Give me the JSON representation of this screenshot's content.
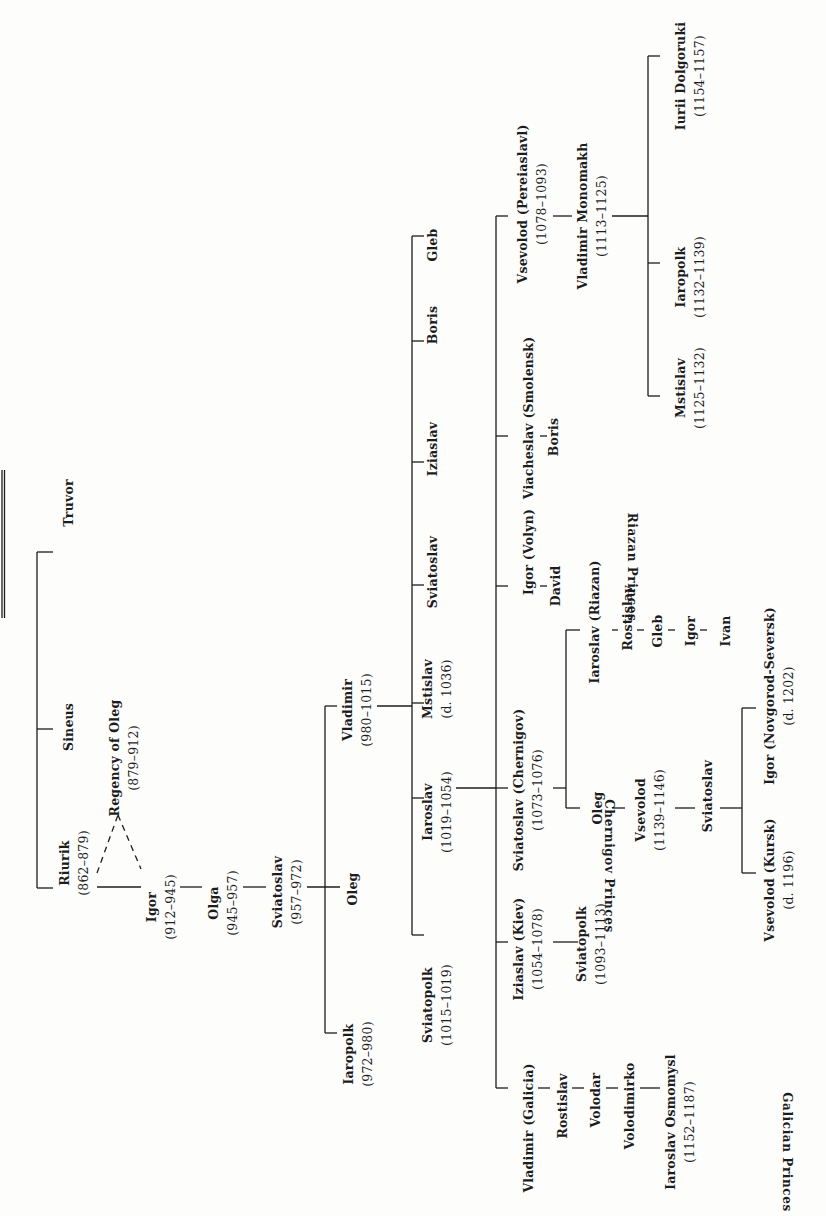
{
  "orientation": "rotated 90 degrees counter-clockwise",
  "colors": {
    "background": "#fdfdfc",
    "ink": "#1c1c1c"
  },
  "nodes": {
    "truvor": {
      "name": "Truvor",
      "dates": ""
    },
    "sineus": {
      "name": "Sineus",
      "dates": ""
    },
    "riurik": {
      "name": "Riurik",
      "dates": "(862–879)"
    },
    "regency_oleg": {
      "name": "Regency of Oleg",
      "dates": "(879–912)"
    },
    "igor": {
      "name": "Igor",
      "dates": "(912–945)"
    },
    "olga": {
      "name": "Olga",
      "dates": "(945–957)"
    },
    "sviatoslav_i": {
      "name": "Sviatoslav",
      "dates": "(957–972)"
    },
    "oleg_i": {
      "name": "Oleg",
      "dates": ""
    },
    "iaropolk_i": {
      "name": "Iaropolk",
      "dates": "(972–980)"
    },
    "vladimir_i": {
      "name": "Vladimir",
      "dates": "(980–1015)"
    },
    "sviatopolk_i": {
      "name": "Sviatopolk",
      "dates": "(1015–1019)"
    },
    "iaroslav_i": {
      "name": "Iaroslav",
      "dates": "(1019–1054)"
    },
    "mstislav_i": {
      "name": "Mstislav",
      "dates": "(d. 1036)"
    },
    "sviatoslav_v": {
      "name": "Sviatoslav",
      "dates": ""
    },
    "iziaslav_v": {
      "name": "Iziaslav",
      "dates": ""
    },
    "boris_v": {
      "name": "Boris",
      "dates": ""
    },
    "gleb_v": {
      "name": "Gleb",
      "dates": ""
    },
    "vladimir_galicia": {
      "name": "Vladimir (Galicia)",
      "dates": ""
    },
    "rostislav_g": {
      "name": "Rostislav",
      "dates": ""
    },
    "volodar": {
      "name": "Volodar",
      "dates": ""
    },
    "volodimirko": {
      "name": "Volodimirko",
      "dates": ""
    },
    "iaroslav_osmomysl": {
      "name": "Iaroslav Osmomysl",
      "dates": "(1152–1187)"
    },
    "iziaslav_kiev": {
      "name": "Iziaslav (Kiev)",
      "dates": "(1054–1078)"
    },
    "sviatopolk_ii": {
      "name": "Sviatopolk",
      "dates": "(1093–1113)"
    },
    "sviatoslav_chernigov": {
      "name": "Sviatoslav (Chernigov)",
      "dates": "(1073–1076)"
    },
    "oleg_c": {
      "name": "Oleg",
      "dates": ""
    },
    "vsevolod_c": {
      "name": "Vsevolod",
      "dates": "(1139–1146)"
    },
    "sviatoslav_c": {
      "name": "Sviatoslav",
      "dates": ""
    },
    "vsevolod_kursk": {
      "name": "Vsevolod (Kursk)",
      "dates": "(d. 1196)"
    },
    "igor_ns": {
      "name": "Igor (Novgorod-Seversk)",
      "dates": "(d. 1202)"
    },
    "iaroslav_riazan": {
      "name": "Iaroslav (Riazan)",
      "dates": ""
    },
    "rostislav_r": {
      "name": "Rostislav",
      "dates": ""
    },
    "gleb_r": {
      "name": "Gleb",
      "dates": ""
    },
    "igor_r": {
      "name": "Igor",
      "dates": ""
    },
    "ivan_r": {
      "name": "Ivan",
      "dates": ""
    },
    "igor_volyn": {
      "name": "Igor (Volyn)",
      "dates": ""
    },
    "david": {
      "name": "David",
      "dates": ""
    },
    "viacheslav": {
      "name": "Viacheslav (Smolensk)",
      "dates": ""
    },
    "boris_s": {
      "name": "Boris",
      "dates": ""
    },
    "vsevolod_p": {
      "name": "Vsevolod  (Pereiaslavl)",
      "dates": "(1078–1093)"
    },
    "vladimir_monomakh": {
      "name": "Vladimir Monomakh",
      "dates": "(1113–1125)"
    },
    "mstislav_m": {
      "name": "Mstislav",
      "dates": "(1125–1132)"
    },
    "iaropolk_m": {
      "name": "Iaropolk",
      "dates": "(1132–1139)"
    },
    "iurii_dolgoruki": {
      "name": "Iurii  Dolgoruki",
      "dates": "(1154–1157)"
    }
  },
  "groups": {
    "galician": "Galician Princes",
    "chernigov": "Chernigov Princes",
    "riazan": "Riazan Princes"
  }
}
